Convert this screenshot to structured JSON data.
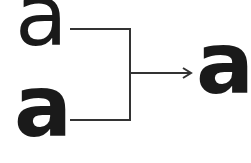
{
  "diagram": {
    "inputs": [
      {
        "label": "a",
        "weight": "regular"
      },
      {
        "label": "a",
        "weight": "bold"
      }
    ],
    "output": {
      "label": "a",
      "weight": "bold"
    },
    "colors": {
      "ink": "#1a1a1a",
      "line": "#333333",
      "background": "#ffffff"
    }
  }
}
